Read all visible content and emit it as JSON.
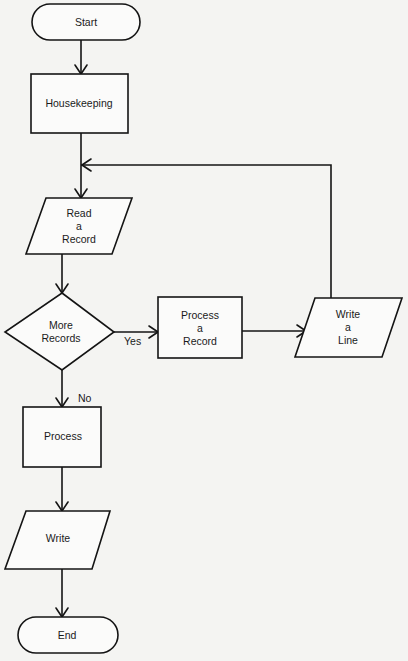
{
  "diagram": {
    "type": "flowchart",
    "nodes": [
      {
        "id": "start",
        "shape": "terminal",
        "label": "Start"
      },
      {
        "id": "housekeeping",
        "shape": "process",
        "label": "Housekeeping"
      },
      {
        "id": "read",
        "shape": "input-output",
        "label": "Read\na\nRecord"
      },
      {
        "id": "more",
        "shape": "decision",
        "label": "More\nRecords"
      },
      {
        "id": "process_record",
        "shape": "process",
        "label": "Process\na\nRecord"
      },
      {
        "id": "write_line",
        "shape": "input-output",
        "label": "Write\na\nLine"
      },
      {
        "id": "process",
        "shape": "process",
        "label": "Process"
      },
      {
        "id": "write",
        "shape": "input-output",
        "label": "Write"
      },
      {
        "id": "end",
        "shape": "terminal",
        "label": "End"
      }
    ],
    "edges": [
      {
        "from": "start",
        "to": "housekeeping",
        "label": ""
      },
      {
        "from": "housekeeping",
        "to": "read",
        "label": ""
      },
      {
        "from": "read",
        "to": "more",
        "label": ""
      },
      {
        "from": "more",
        "to": "process_record",
        "label": "Yes"
      },
      {
        "from": "process_record",
        "to": "write_line",
        "label": ""
      },
      {
        "from": "write_line",
        "to": "read",
        "label": ""
      },
      {
        "from": "more",
        "to": "process",
        "label": "No"
      },
      {
        "from": "process",
        "to": "write",
        "label": ""
      },
      {
        "from": "write",
        "to": "end",
        "label": ""
      }
    ],
    "edge_labels": {
      "yes": "Yes",
      "no": "No"
    }
  }
}
